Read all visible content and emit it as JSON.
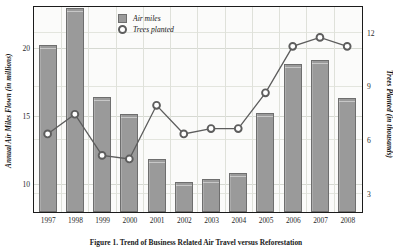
{
  "chart_data": {
    "type": "bar",
    "title": "",
    "xlabel": "",
    "ylabel": "Annual Air Miles Flown (in millions)",
    "ylabel_right": "Trees Planted (in thousands)",
    "categories": [
      "1997",
      "1998",
      "1999",
      "2000",
      "2001",
      "2002",
      "2003",
      "2004",
      "2005",
      "2006",
      "2007",
      "2008"
    ],
    "ylim": [
      8,
      23
    ],
    "yticks": [
      10,
      15,
      20
    ],
    "ylim_right": [
      2,
      13.4
    ],
    "yticks_right": [
      3,
      6,
      9,
      12
    ],
    "grid": true,
    "legend_position": "top-center",
    "series": [
      {
        "name": "Air miles",
        "type": "bar",
        "unit": "millions",
        "color": "#9a9a9a",
        "values": [
          20.3,
          23.0,
          16.5,
          15.2,
          11.9,
          10.2,
          10.4,
          10.9,
          15.3,
          18.9,
          19.2,
          16.4
        ]
      },
      {
        "name": "Trees planted",
        "type": "line",
        "unit": "thousands",
        "color": "#5d5d5d",
        "marker": "circle-open",
        "values": [
          6.3,
          7.4,
          5.1,
          4.9,
          7.9,
          6.3,
          6.6,
          6.6,
          8.6,
          11.2,
          11.7,
          11.2
        ]
      }
    ]
  },
  "legend": {
    "items": [
      {
        "label": "Air miles",
        "marker": "square-swatch"
      },
      {
        "label": "Trees planted",
        "marker": "open-circle"
      }
    ]
  },
  "axes": {
    "left_title": "Annual Air Miles Flown (in millions)",
    "right_title": "Trees Planted (in thousands)",
    "left_ticks": [
      "20",
      "15",
      "10"
    ],
    "right_ticks": [
      "12",
      "9",
      "6",
      "3"
    ],
    "x_ticks": [
      "1997",
      "1998",
      "1999",
      "2000",
      "2001",
      "2002",
      "2003",
      "2004",
      "2005",
      "2006",
      "2007",
      "2008"
    ]
  },
  "caption": {
    "text": "Figure 1. Trend of Business Related Air Travel versus Reforestation"
  }
}
